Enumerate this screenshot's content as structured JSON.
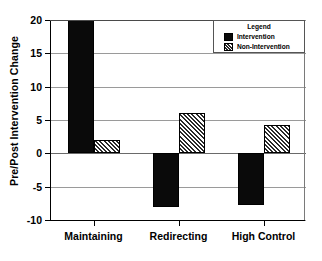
{
  "chart_data": {
    "type": "bar",
    "title": "",
    "xlabel": "",
    "ylabel": "Pre/Post Intervention Change",
    "categories": [
      "Maintaining",
      "Redirecting",
      "High Control"
    ],
    "series": [
      {
        "name": "Intervention",
        "values": [
          20,
          -8,
          -7.8
        ],
        "fill": "solid"
      },
      {
        "name": "Non-Intervention",
        "values": [
          2,
          6.1,
          4.2
        ],
        "fill": "hatch"
      }
    ],
    "ylim": [
      -10,
      20
    ],
    "yticks": [
      20,
      15,
      10,
      5,
      0,
      -5,
      -10
    ],
    "ytick_labels": [
      "20",
      "15",
      "10",
      "5",
      "0",
      "-5",
      "-10"
    ],
    "grid": true,
    "legend": {
      "title": "Legend",
      "position": "top-right",
      "entries": [
        {
          "label": "Intervention",
          "fill": "solid"
        },
        {
          "label": "Non-Intervention",
          "fill": "hatch"
        }
      ]
    }
  },
  "colors": {
    "solid": "#0a0a0a",
    "hatch_line": "#2b2b2b",
    "background": "#ffffff",
    "grid": "#9a9a9a",
    "axis": "#000000"
  }
}
